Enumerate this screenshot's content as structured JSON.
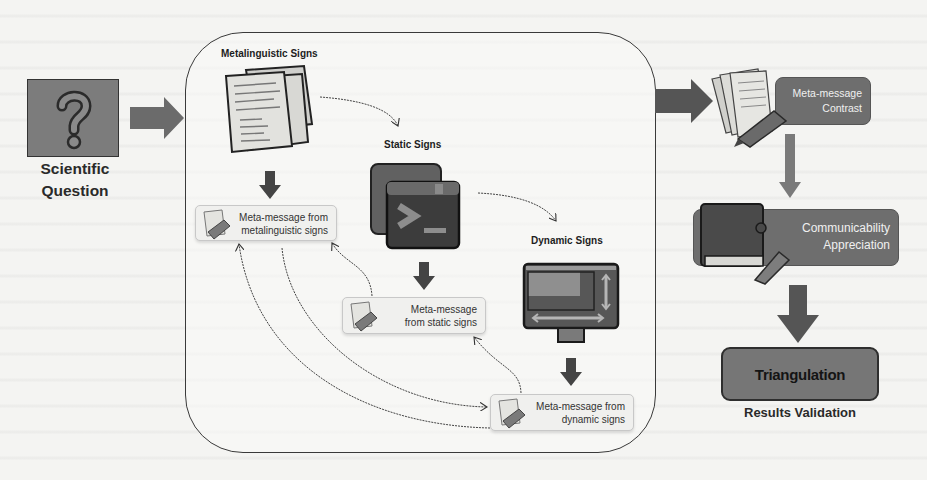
{
  "input": {
    "icon": "question-mark-icon",
    "label_line1": "Scientific",
    "label_line2": "Question"
  },
  "analysis_panel": {
    "metalinguistic": {
      "title": "Metalinguistic Signs",
      "icon": "documents-icon",
      "meta_message_line1": "Meta-message from",
      "meta_message_line2": "metalinguistic signs"
    },
    "static": {
      "title": "Static Signs",
      "icon": "terminal-window-icon",
      "meta_message_line1": "Meta-message",
      "meta_message_line2": "from static signs"
    },
    "dynamic": {
      "title": "Dynamic Signs",
      "icon": "monitor-icon",
      "meta_message_line1": "Meta-message from",
      "meta_message_line2": "dynamic signs"
    }
  },
  "output_column": {
    "contrast": {
      "icon": "papers-pen-icon",
      "line1": "Meta-message",
      "line2": "Contrast"
    },
    "communicability": {
      "icon": "book-pen-icon",
      "line1": "Communicability",
      "line2": "Appreciation"
    },
    "triangulation": {
      "label": "Triangulation",
      "caption": "Results Validation"
    }
  },
  "colors": {
    "arrow": "#6b6b6b",
    "dark_box": "#6e6e6e",
    "panel_border": "#3a3a3a",
    "background": "#f4f4f2"
  }
}
